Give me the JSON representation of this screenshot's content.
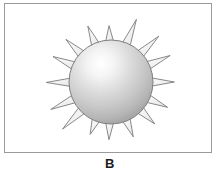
{
  "figure": {
    "caption": "B",
    "background_color": "#ffffff",
    "frame": {
      "border_color": "#9a9a9a",
      "border_width": 1,
      "fill_color": "#ffffff"
    },
    "illustration": {
      "name": "spiked-sphere",
      "description": "Shaded sphere with radiating spikes",
      "center_x": 106,
      "center_y": 78,
      "sphere_radius": 42,
      "spike_count": 16,
      "spike_outer_radius": 62,
      "spike_half_width_deg": 6.5,
      "sphere_outline_color": "#808080",
      "sphere_highlight_color": "#ffffff",
      "sphere_mid_color": "#cfcfcf",
      "sphere_edge_color": "#9d9d9d",
      "spike_outline_color": "#7c7c7c",
      "spike_fill_color": "#f2f2f2",
      "highlight_offset_x": -0.12,
      "highlight_offset_y": -0.22
    }
  }
}
